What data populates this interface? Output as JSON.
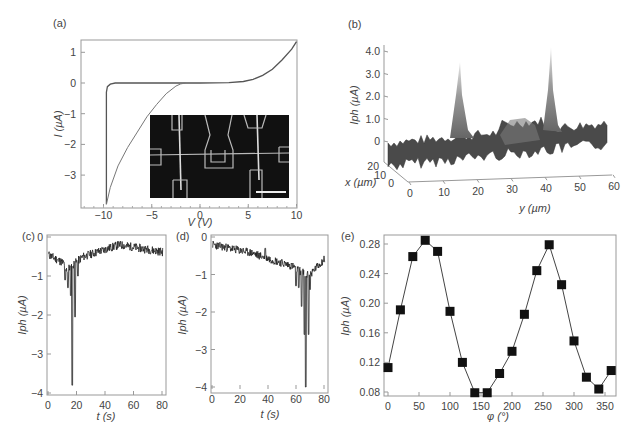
{
  "chart_data": [
    {
      "panel": "(a)",
      "type": "line",
      "xlabel": "V (V)",
      "ylabel": "I (µA)",
      "xlim": [
        -12.3,
        10
      ],
      "ylim": [
        -4.1,
        1.4
      ],
      "xticks": [
        "-10",
        "-5",
        "0",
        "5",
        "10"
      ],
      "yticks": [
        "1",
        "0",
        "-1",
        "-2",
        "-3"
      ],
      "series": [
        {
          "name": "forward sweep",
          "x": [
            -9.7,
            -9.7,
            -9.6,
            -9.3,
            -8.8,
            -5,
            0,
            3,
            4.5,
            5.5,
            6.5,
            7.5,
            8.5,
            9.5,
            10
          ],
          "y": [
            -3.95,
            -0.3,
            -0.12,
            -0.04,
            0,
            0,
            0,
            0.01,
            0.05,
            0.12,
            0.25,
            0.45,
            0.75,
            1.1,
            1.35
          ]
        },
        {
          "name": "reverse sweep",
          "x": [
            -9.7,
            -9.3,
            -8.5,
            -7.5,
            -6.5,
            -5.5,
            -4.5,
            -3.5,
            -2.5,
            -2,
            -1.5
          ],
          "y": [
            -3.95,
            -3.4,
            -2.7,
            -2.1,
            -1.6,
            -1.1,
            -0.7,
            -0.35,
            -0.1,
            -0.03,
            0
          ]
        }
      ],
      "inset": "SEM micrograph of device with electrodes and scale bar"
    },
    {
      "panel": "(b)",
      "type": "area",
      "subtype": "3d-surface",
      "zlabel": "Iph (µA)",
      "xlabel": "x (µm)",
      "ylabel": "y (µm)",
      "zticks": [
        "4.0",
        "3.0",
        "2.0",
        "1.0",
        "0"
      ],
      "xticks": [
        "20",
        "10",
        "0"
      ],
      "yticks": [
        "0",
        "10",
        "20",
        "30",
        "40",
        "50",
        "60"
      ],
      "peaks": [
        {
          "y": 15,
          "Iph": 3.8
        },
        {
          "y": 40,
          "Iph": 4.3
        }
      ]
    },
    {
      "panel": "(c)",
      "type": "line",
      "xlabel": "t (s)",
      "ylabel": "Iph (µA)",
      "xlim": [
        0,
        82
      ],
      "ylim": [
        -4,
        0
      ],
      "xticks": [
        "0",
        "20",
        "40",
        "60",
        "80"
      ],
      "yticks": [
        "0",
        "-1",
        "-2",
        "-3",
        "-4"
      ],
      "min_point": {
        "t": 17,
        "Iph": -3.8
      },
      "baseline": -0.4
    },
    {
      "panel": "(d)",
      "type": "line",
      "xlabel": "t (s)",
      "ylabel": "Iph (µA)",
      "xlim": [
        0,
        82
      ],
      "ylim": [
        -4.2,
        0
      ],
      "xticks": [
        "0",
        "20",
        "40",
        "60",
        "80"
      ],
      "yticks": [
        "0",
        "-1",
        "-2",
        "-3",
        "-4"
      ],
      "min_point": {
        "t": 67,
        "Iph": -4.0
      },
      "baseline": -0.2
    },
    {
      "panel": "(e)",
      "type": "scatter",
      "xlabel": "φ (°)",
      "ylabel": "Iph (µA)",
      "xlim": [
        -5,
        365
      ],
      "ylim": [
        0.075,
        0.29
      ],
      "xticks": [
        "0",
        "50",
        "100",
        "150",
        "200",
        "250",
        "300",
        "350"
      ],
      "yticks": [
        "0.28",
        "0.24",
        "0.20",
        "0.16",
        "0.12",
        "0.08"
      ],
      "x": [
        0,
        20,
        40,
        60,
        80,
        100,
        120,
        140,
        160,
        180,
        200,
        220,
        240,
        260,
        280,
        300,
        320,
        340,
        360
      ],
      "values": [
        0.113,
        0.191,
        0.263,
        0.285,
        0.27,
        0.189,
        0.12,
        0.079,
        0.079,
        0.105,
        0.135,
        0.185,
        0.244,
        0.279,
        0.225,
        0.149,
        0.1,
        0.084,
        0.109
      ]
    }
  ],
  "labels": {
    "a": "(a)",
    "b": "(b)",
    "c": "(c)",
    "d": "(d)",
    "e": "(e)",
    "a_x": "V (V)",
    "a_y": "I (µA)",
    "b_z": "Iph (µA)",
    "b_x": "x (µm)",
    "b_y": "y (µm)",
    "t_s": "t (s)",
    "iph": "Iph (µA)",
    "phi": "φ (°)"
  }
}
